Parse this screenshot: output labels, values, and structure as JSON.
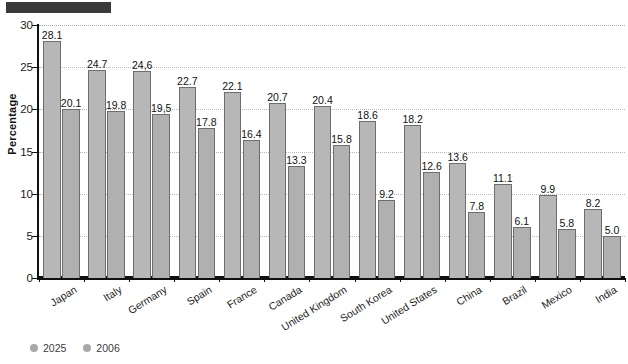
{
  "chart_data": {
    "type": "bar",
    "title": "",
    "xlabel": "",
    "ylabel": "Percentage",
    "ylim": [
      0,
      30
    ],
    "yticks": [
      0,
      5,
      10,
      15,
      20,
      25,
      30
    ],
    "ytick_labels": [
      "0",
      "5",
      "10",
      "15",
      "20",
      "25",
      "30"
    ],
    "grid": "horizontal-dotted",
    "legend_position": "bottom-left",
    "categories": [
      "Japan",
      "Italy",
      "Germany",
      "Spain",
      "France",
      "Canada",
      "United Kingdom",
      "South Korea",
      "United States",
      "China",
      "Brazil",
      "Mexico",
      "India"
    ],
    "series": [
      {
        "name": "2025",
        "color": "#b7b7b7",
        "values": [
          28.1,
          24.7,
          24.6,
          22.7,
          22.1,
          20.7,
          20.4,
          18.6,
          18.2,
          13.6,
          11.1,
          9.9,
          8.2
        ],
        "labels": [
          "28.1",
          "24.7",
          "24,6",
          "22.7",
          "22.1",
          "20.7",
          "20.4",
          "18.6",
          "18.2",
          "13.6",
          "11.1",
          "9.9",
          "8.2"
        ]
      },
      {
        "name": "2006",
        "color": "#b0b0b0",
        "values": [
          20.1,
          19.8,
          19.5,
          17.8,
          16.4,
          13.3,
          15.8,
          9.2,
          12.6,
          7.8,
          6.1,
          5.8,
          5.0
        ],
        "labels": [
          "20.1",
          "19.8",
          "19,5",
          "17.8",
          "16.4",
          "13.3",
          "15.8",
          "9.2",
          "12.6",
          "7.8",
          "6.1",
          "5.8",
          "5.0"
        ]
      }
    ]
  },
  "legend": {
    "items": [
      {
        "label": "2025",
        "marker": "circle-marker",
        "color": "#a8a8a8"
      },
      {
        "label": "2006",
        "marker": "circle-marker",
        "color": "#a8a8a8"
      }
    ]
  },
  "axis": {
    "y_title": "Percentage"
  },
  "title_block": {
    "redacted": true
  }
}
